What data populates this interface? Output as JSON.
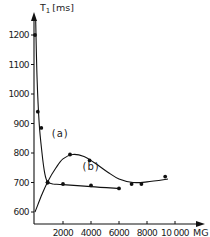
{
  "chart_data": {
    "type": "scatter",
    "title": "",
    "xlabel": "MG",
    "ylabel": "T1 [ms]",
    "ylabel_main": "T",
    "ylabel_sub": "1",
    "ylabel_unit": "[ms]",
    "xlim": [
      0,
      11000
    ],
    "ylim": [
      600,
      1250
    ],
    "grid": false,
    "legend": "none (curves labelled inline)",
    "x_ticks": [
      2000,
      4000,
      6000,
      8000,
      10000
    ],
    "x_tick_labels": [
      "2000",
      "4000",
      "6000",
      "8000",
      "10 000"
    ],
    "y_ticks": [
      600,
      700,
      800,
      900,
      1000,
      1100,
      1200
    ],
    "y_tick_labels": [
      "600",
      "700",
      "800",
      "900",
      "1000",
      "1100",
      "1200"
    ],
    "series": [
      {
        "name": "(a)",
        "label": "(a)",
        "points": [
          {
            "x": 0,
            "y": 1200
          },
          {
            "x": 200,
            "y": 940
          },
          {
            "x": 450,
            "y": 885
          },
          {
            "x": 900,
            "y": 700
          },
          {
            "x": 2000,
            "y": 695
          },
          {
            "x": 4000,
            "y": 690
          },
          {
            "x": 6000,
            "y": 680
          }
        ],
        "curve": [
          [
            50,
            1250
          ],
          [
            150,
            1050
          ],
          [
            300,
            900
          ],
          [
            500,
            800
          ],
          [
            700,
            730
          ],
          [
            900,
            702
          ],
          [
            1300,
            695
          ],
          [
            2000,
            693
          ],
          [
            4000,
            686
          ],
          [
            6000,
            680
          ]
        ]
      },
      {
        "name": "(b)",
        "label": "(b)",
        "points": [
          {
            "x": 900,
            "y": 700
          },
          {
            "x": 2500,
            "y": 795
          },
          {
            "x": 3900,
            "y": 775
          },
          {
            "x": 6900,
            "y": 695
          },
          {
            "x": 7600,
            "y": 695
          },
          {
            "x": 9300,
            "y": 720
          }
        ],
        "curve": [
          [
            0,
            600
          ],
          [
            500,
            660
          ],
          [
            900,
            702
          ],
          [
            1500,
            750
          ],
          [
            2000,
            780
          ],
          [
            2700,
            795
          ],
          [
            3500,
            788
          ],
          [
            4300,
            765
          ],
          [
            5200,
            735
          ],
          [
            6000,
            712
          ],
          [
            7000,
            700
          ],
          [
            8000,
            702
          ],
          [
            9500,
            712
          ]
        ]
      }
    ],
    "annotations": [
      {
        "text": "(a)",
        "x": 1200,
        "y": 855
      },
      {
        "text": "(b)",
        "x": 3400,
        "y": 742
      }
    ]
  }
}
